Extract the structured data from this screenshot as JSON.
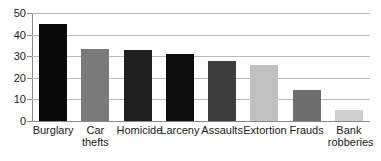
{
  "chart_data": {
    "type": "bar",
    "title": "",
    "xlabel": "",
    "ylabel": "",
    "categories": [
      "Burglary",
      "Car thefts",
      "Homicide",
      "Larceny",
      "Assaults",
      "Extortion",
      "Frauds",
      "Bank robberies"
    ],
    "values": [
      45,
      33.5,
      33,
      31,
      28,
      26,
      14.5,
      5
    ],
    "bar_colors": [
      "#0a0a0a",
      "#7a7a7a",
      "#1f1f1f",
      "#0d0d0d",
      "#3d3d3d",
      "#c0c0c0",
      "#6e6e6e",
      "#cfcfcf"
    ],
    "ylim": [
      0,
      50
    ],
    "ytick_labels": [
      "0",
      "10",
      "20",
      "30",
      "40",
      "50"
    ],
    "ytick_values": [
      0,
      10,
      20,
      30,
      40,
      50
    ],
    "grid": true,
    "legend": "none",
    "axis_color": "#8a8a8a",
    "grid_color": "#b9b9b9",
    "background": "#ffffff"
  },
  "axis": {
    "y_labels": {
      "t0": "0",
      "t10": "10",
      "t20": "20",
      "t30": "30",
      "t40": "40",
      "t50": "50"
    }
  },
  "x_labels": {
    "b0": "Burglary",
    "b1": "Car\nthefts",
    "b2": "Homicide",
    "b3": "Larceny",
    "b4": "Assaults",
    "b5": "Extortion",
    "b6": "Frauds",
    "b7": "Bank\nrobberies"
  }
}
